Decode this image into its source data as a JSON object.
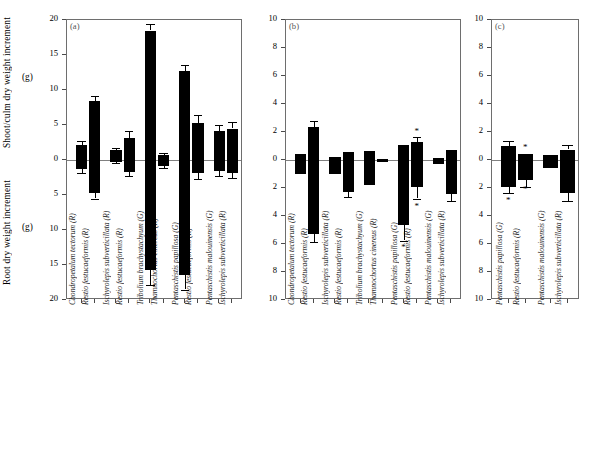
{
  "figure": {
    "ylabel_shoot": "Shoot/culm dry weight increment",
    "ylabel_root": "Root dry weight increment",
    "yunit": "(g)"
  },
  "chart_data": {
    "type": "bar",
    "title": "",
    "xlabel": "",
    "ylabel": "Shoot/culm dry weight increment (g) / Root dry weight increment (g)",
    "grid": false,
    "legend": "none",
    "note": "Each species pair shows shoot/culm increment above the zero line and root increment below it; error bars are SE; asterisks mark significant differences.",
    "panels": [
      {
        "tag": "(a)",
        "ylim": [
          -20,
          20
        ],
        "yticks": [
          20,
          15,
          10,
          5,
          0,
          5,
          10,
          15,
          20
        ],
        "ytick_values": [
          20,
          15,
          10,
          5,
          0,
          -5,
          -10,
          -15,
          -20
        ],
        "categories": [
          "Chondropetalum tectorum (R)",
          "Restio festucaeformis (R)",
          "Ischyrolepis subverticillata (R)",
          "Restio festucaeformis (R)",
          "Tribolium brachystachyum (G)",
          "Thamnochortus cinereus (R)",
          "Pentaschistis papillosa (G)",
          "Restio festucaeformis (R)",
          "Pentaschistis malouinensis (G)",
          "Ischyrolepis subverticillata (R)"
        ],
        "groups": [
          [
            0,
            1
          ],
          [
            2,
            3
          ],
          [
            4,
            5
          ],
          [
            6,
            7
          ],
          [
            8,
            9
          ]
        ],
        "shoot": [
          2.1,
          8.4,
          1.4,
          3.2,
          18.5,
          0.7,
          12.7,
          5.3,
          4.2,
          4.5
        ],
        "shoot_err": [
          0.6,
          0.7,
          0.35,
          0.9,
          0.9,
          0.25,
          0.9,
          1.1,
          0.8,
          0.9
        ],
        "root": [
          -1.3,
          -4.7,
          -0.25,
          -1.7,
          -15.7,
          -0.8,
          -16.4,
          -1.8,
          -1.6,
          -1.8
        ],
        "root_err": [
          0.5,
          0.8,
          0.2,
          0.6,
          2.2,
          0.35,
          2.1,
          0.9,
          0.7,
          0.8
        ],
        "stars_above": [],
        "stars_below": []
      },
      {
        "tag": "(b)",
        "ylim": [
          -10,
          10
        ],
        "yticks": [
          10,
          8,
          6,
          4,
          2,
          0,
          2,
          4,
          6,
          8,
          10
        ],
        "ytick_values": [
          10,
          8,
          6,
          4,
          2,
          0,
          -2,
          -4,
          -6,
          -8,
          -10
        ],
        "categories": [
          "Chondropetalum tectorum (R)",
          "Restio festucaeformis (R)",
          "Ischyrolepis subverticillata (R)",
          "Restio festucaeformis (R)",
          "Tribolium brachystachyum (G)",
          "Thamnochortus cinereus (R)",
          "Pentaschistis papillosa (G)",
          "Restio festucaeformis (R)",
          "Pentaschistis malouinensis (G)",
          "Ischyrolepis subverticillata (R)"
        ],
        "groups": [
          [
            0,
            1
          ],
          [
            2,
            3
          ],
          [
            4,
            5
          ],
          [
            6,
            7
          ],
          [
            8,
            9
          ]
        ],
        "shoot": [
          0.4,
          2.35,
          0.25,
          0.6,
          0.65,
          0.1,
          1.05,
          1.3,
          0.15,
          0.75
        ],
        "shoot_err": [
          0.0,
          0.45,
          0.0,
          0.0,
          0.0,
          0.0,
          0.0,
          0.35,
          0.0,
          0.0
        ],
        "root": [
          -1.0,
          -5.3,
          -1.0,
          -2.3,
          -1.75,
          -0.1,
          -4.65,
          -1.9,
          -0.25,
          -2.45
        ],
        "root_err": [
          0.0,
          0.55,
          0.0,
          0.35,
          0.0,
          0.0,
          1.1,
          0.85,
          0.0,
          0.5
        ],
        "stars_above": [
          {
            "bar": 7,
            "value": 2.1
          }
        ],
        "stars_below": [
          {
            "bar": 6,
            "value": -6.2
          },
          {
            "bar": 7,
            "value": -3.3
          }
        ]
      },
      {
        "tag": "(c)",
        "ylim": [
          -10,
          10
        ],
        "yticks": [
          10,
          8,
          6,
          4,
          2,
          0,
          2,
          4,
          6,
          8,
          10
        ],
        "ytick_values": [
          10,
          8,
          6,
          4,
          2,
          0,
          -2,
          -4,
          -6,
          -8,
          -10
        ],
        "categories": [
          "Pentaschistis papillosa (G)",
          "Restio festucaeformis (R)",
          "Pentaschistis malouinensis (G)",
          "Ischyrolepis subverticillata (R)"
        ],
        "groups": [
          [
            0,
            1
          ],
          [
            2,
            3
          ]
        ],
        "shoot": [
          1.0,
          0.45,
          0.35,
          0.75
        ],
        "shoot_err": [
          0.35,
          0.0,
          0.0,
          0.35
        ],
        "root": [
          -1.9,
          -1.45,
          -0.6,
          -2.35
        ],
        "root_err": [
          0.45,
          0.45,
          0.0,
          0.6
        ],
        "stars_above": [
          {
            "bar": 1,
            "value": 0.9
          }
        ],
        "stars_below": [
          {
            "bar": 0,
            "value": -2.85
          },
          {
            "bar": 1,
            "value": -2.1
          }
        ]
      }
    ]
  }
}
